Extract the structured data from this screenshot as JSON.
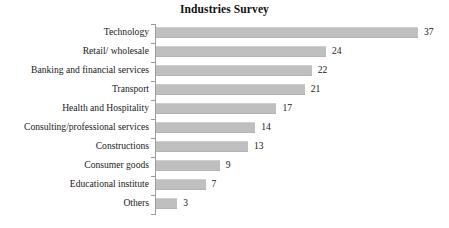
{
  "chart_data": {
    "type": "bar",
    "orientation": "horizontal",
    "title": "Industries Survey",
    "xlabel": "",
    "ylabel": "",
    "grid": false,
    "legend": null,
    "xlim": [
      0,
      37
    ],
    "bar_color": "#bfbfbf",
    "axis_color": "#9a9a9a",
    "text_color": "#1a1a1a",
    "background": "#ffffff",
    "categories": [
      "Technology",
      "Retail/ wholesale",
      "Banking and financial services",
      "Transport",
      "Health and Hospitality",
      "Consulting/professional services",
      "Constructions",
      "Consumer goods",
      "Educational institute",
      "Others"
    ],
    "values": [
      37,
      24,
      22,
      21,
      17,
      14,
      13,
      9,
      7,
      3
    ],
    "data_labels": [
      "37",
      "24",
      "22",
      "21",
      "17",
      "14",
      "13",
      "9",
      "7",
      "3"
    ]
  }
}
